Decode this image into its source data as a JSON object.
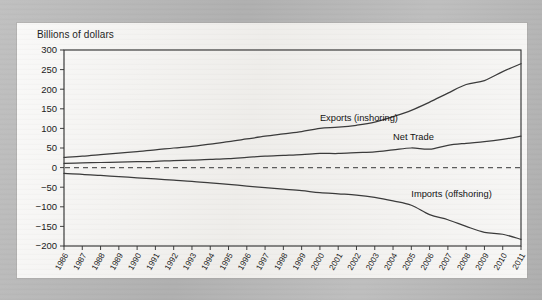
{
  "page": {
    "background_color": "#b9b9b9",
    "panel_color": "#f2f1ef"
  },
  "chart_data": {
    "type": "line",
    "title": "Billions of dollars",
    "xlabel": "",
    "ylabel": "Billions of dollars",
    "ylim": [
      -200,
      300
    ],
    "yticks": [
      300,
      250,
      200,
      150,
      100,
      50,
      0,
      -50,
      -100,
      -150,
      -200
    ],
    "ytick_labels": [
      "300",
      "250",
      "200",
      "150",
      "100",
      "50",
      "0",
      "−50",
      "−100",
      "−150",
      "−200"
    ],
    "grid": false,
    "legend_position": "inline-annotations",
    "reference_lines": [
      {
        "y": 0,
        "style": "dashed"
      }
    ],
    "categories": [
      "1986",
      "1987",
      "1988",
      "1989",
      "1990",
      "1991",
      "1992",
      "1993",
      "1994",
      "1995",
      "1996",
      "1997",
      "1998",
      "1999",
      "2000",
      "2001",
      "2002",
      "2003",
      "2004",
      "2005",
      "2006",
      "2007",
      "2008",
      "2009",
      "2010",
      "2011"
    ],
    "series": [
      {
        "name": "Exports (inshoring)",
        "values": [
          26,
          29,
          33,
          37,
          41,
          45,
          50,
          54,
          60,
          66,
          73,
          80,
          86,
          92,
          100,
          103,
          108,
          116,
          130,
          146,
          167,
          190,
          212,
          222,
          245,
          265
        ]
      },
      {
        "name": "Net Trade",
        "values": [
          11,
          12,
          13,
          14,
          15,
          16,
          18,
          19,
          21,
          23,
          26,
          29,
          31,
          33,
          36,
          36,
          38,
          40,
          45,
          50,
          47,
          57,
          62,
          66,
          72,
          80
        ]
      },
      {
        "name": "Imports (offshoring)",
        "values": [
          -15,
          -17,
          -20,
          -23,
          -26,
          -29,
          -32,
          -35,
          -39,
          -43,
          -47,
          -51,
          -55,
          -59,
          -64,
          -67,
          -70,
          -76,
          -85,
          -96,
          -120,
          -133,
          -150,
          -165,
          -170,
          -183
        ]
      }
    ],
    "annotations": [
      {
        "text": "Exports (inshoring)",
        "x": 2000,
        "y": 118
      },
      {
        "text": "Net Trade",
        "x": 2004,
        "y": 70
      },
      {
        "text": "Imports (offshoring)",
        "x": 2005,
        "y": -75
      }
    ]
  }
}
